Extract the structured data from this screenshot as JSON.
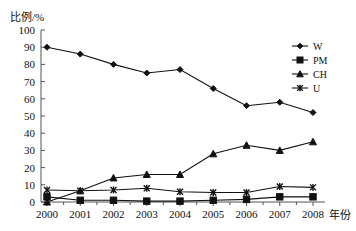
{
  "chart_data": {
    "type": "line",
    "title": "",
    "ylabel": "比例/%",
    "xlabel": "年份",
    "categories": [
      "2000",
      "2001",
      "2002",
      "2003",
      "2004",
      "2005",
      "2006",
      "2007",
      "2008"
    ],
    "x": [
      2000,
      2001,
      2002,
      2003,
      2004,
      2005,
      2006,
      2007,
      2008
    ],
    "ylim": [
      0,
      100
    ],
    "yticks": [
      "0",
      "10",
      "20",
      "30",
      "40",
      "50",
      "60",
      "70",
      "80",
      "90",
      "100"
    ],
    "ytick_values": [
      0,
      10,
      20,
      30,
      40,
      50,
      60,
      70,
      80,
      90,
      100
    ],
    "grid": false,
    "legend_position": "right",
    "series": [
      {
        "name": "W",
        "marker": "diamond",
        "values": [
          90,
          86,
          80,
          75,
          77,
          66,
          56,
          58,
          52
        ]
      },
      {
        "name": "PM",
        "marker": "square",
        "values": [
          3,
          1,
          1,
          0.5,
          0.5,
          1,
          1.5,
          3,
          3
        ]
      },
      {
        "name": "CH",
        "marker": "triangle",
        "values": [
          0,
          6.5,
          14,
          16,
          16,
          28,
          33,
          30,
          35
        ]
      },
      {
        "name": "U",
        "marker": "x",
        "values": [
          7,
          6.5,
          7,
          8,
          6,
          5.5,
          5.5,
          9,
          8.5
        ]
      }
    ]
  },
  "legend": {
    "items": [
      {
        "label": "W"
      },
      {
        "label": "PM"
      },
      {
        "label": "CH"
      },
      {
        "label": "U"
      }
    ]
  },
  "colors": {
    "ink": "#111111",
    "axis": "#555555",
    "background": "#ffffff"
  }
}
